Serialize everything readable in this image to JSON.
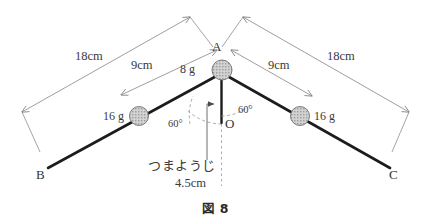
{
  "figure": {
    "caption": "図 8",
    "points": {
      "apex_label": "A",
      "left_end_label": "B",
      "right_end_label": "C",
      "origin_label": "O"
    },
    "masses": {
      "apex": "8 g",
      "left_ball": "16 g",
      "right_ball": "16 g"
    },
    "dimensions": {
      "outer_left": "18cm",
      "outer_right": "18cm",
      "inner_left": "9cm",
      "inner_right": "9cm",
      "toothpick_length": "4.5cm"
    },
    "angles": {
      "left": "60°",
      "right": "60°"
    },
    "annotations": {
      "toothpick": "つまようじ"
    },
    "colors": {
      "rod": "#1c1c1c",
      "dimension_line": "#7a7a7a",
      "ball_fill": "#c9c9c9",
      "text": "#3a3a3a",
      "background": "#ffffff"
    }
  }
}
